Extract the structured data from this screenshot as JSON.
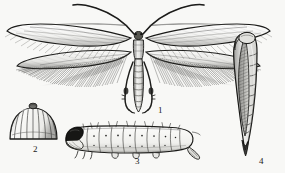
{
  "plate": {
    "title": "Leaf-miner moth life cycle plate",
    "background_color": "#f8f8f6",
    "ink_color": "#1a1a1a",
    "technique": "line engraving / stipple drawing"
  },
  "figures": [
    {
      "number": "1",
      "subject": "adult-moth",
      "description": "Adult moth with wings spread, long narrow lanceolate wings with dense fringe, long curved antennae, segmented abdomen and two long extended legs",
      "label_x": 160,
      "label_y": 111
    },
    {
      "number": "2",
      "subject": "egg",
      "description": "Dome-shaped ribbed egg with small apical knob",
      "label_x": 36,
      "label_y": 150
    },
    {
      "number": "3",
      "subject": "larva",
      "description": "Caterpillar in lateral view, dark head capsule, segmented body with setae and spiracles",
      "label_x": 138,
      "label_y": 161
    },
    {
      "number": "4",
      "subject": "pupa",
      "description": "Elongate pupa with hatched wing case, segmented abdomen and pointed cremaster",
      "label_x": 262,
      "label_y": 161
    }
  ]
}
